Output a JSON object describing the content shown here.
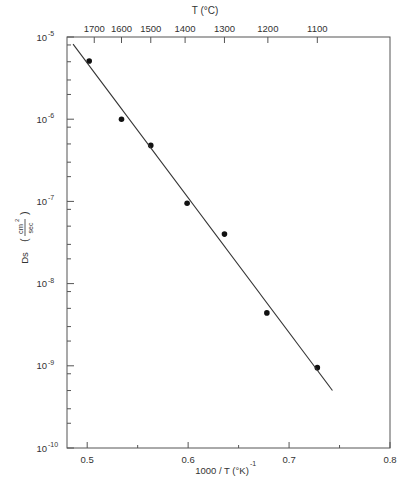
{
  "chart_data": {
    "type": "scatter",
    "title": "",
    "xlabel": "1000 / T (°K)",
    "xlabel_sup": "-1",
    "ylabel": "Ds",
    "ylabel_unit_num": "cm",
    "ylabel_unit_num_sup": "2",
    "ylabel_unit_den": "sec",
    "top_axis_label": "T (°C)",
    "xlim": [
      0.48,
      0.8
    ],
    "ylim": [
      1e-10,
      1e-05
    ],
    "yscale": "log",
    "grid": false,
    "x_ticks": [
      0.5,
      0.6,
      0.7,
      0.8
    ],
    "x_tick_labels": [
      "0.5",
      "0.6",
      "0.7",
      "0.8"
    ],
    "x_minor_ticks": [
      0.55,
      0.65,
      0.75
    ],
    "y_ticks": [
      -10,
      -9,
      -8,
      -7,
      -6,
      -5
    ],
    "y_tick_labels": [
      "10",
      "10",
      "10",
      "10",
      "10",
      "10"
    ],
    "y_tick_exps": [
      "-10",
      "-9",
      "-8",
      "-7",
      "-6",
      "-5"
    ],
    "top_ticks": [
      {
        "label": "1700",
        "x": 0.507
      },
      {
        "label": "1600",
        "x": 0.534
      },
      {
        "label": "1500",
        "x": 0.563
      },
      {
        "label": "1400",
        "x": 0.597
      },
      {
        "label": "1300",
        "x": 0.636
      },
      {
        "label": "1200",
        "x": 0.679
      },
      {
        "label": "1100",
        "x": 0.728
      }
    ],
    "series": [
      {
        "name": "measured Ds",
        "kind": "points",
        "x": [
          0.502,
          0.534,
          0.563,
          0.599,
          0.636,
          0.678,
          0.728
        ],
        "y": [
          5.1e-06,
          1e-06,
          4.8e-07,
          9.5e-08,
          4e-08,
          4.4e-09,
          9.5e-10
        ]
      },
      {
        "name": "fit line",
        "kind": "line",
        "x": [
          0.486,
          0.743
        ],
        "y": [
          8.2e-06,
          5e-10
        ]
      }
    ]
  }
}
